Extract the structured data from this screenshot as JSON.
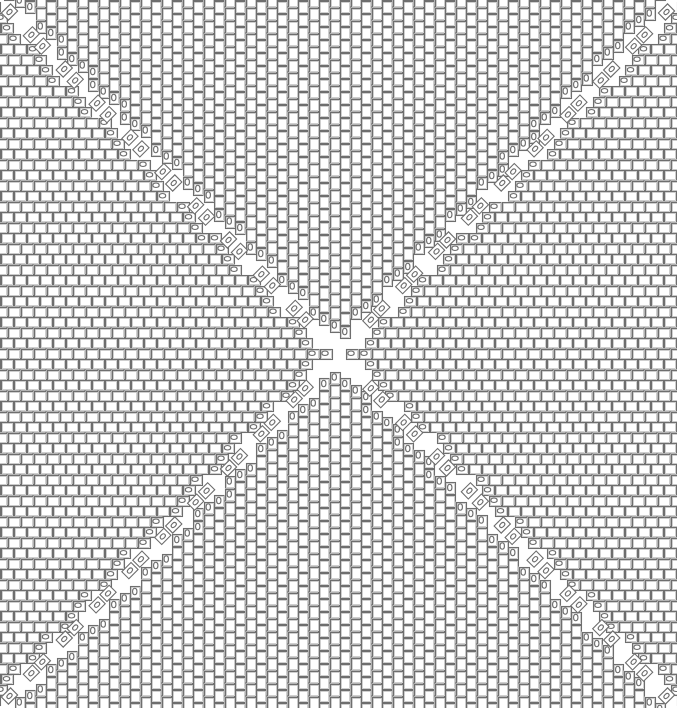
{
  "title": "Brick tiling pattern with diagonal marked tiles",
  "canvas": {
    "width": 677,
    "height": 708
  },
  "pattern": {
    "center": {
      "x": 338,
      "y": 354
    },
    "pitch": 10.5,
    "brick_long": 13,
    "brick_short": 9.5,
    "stroke_color": "#6e6e6e",
    "fill_color": "#ffffff",
    "line_width": 1.1,
    "regions": [
      {
        "name": "top",
        "orientation": "vertical"
      },
      {
        "name": "bottom",
        "orientation": "vertical"
      },
      {
        "name": "left",
        "orientation": "horizontal"
      },
      {
        "name": "right",
        "orientation": "horizontal"
      }
    ],
    "diagonal_marker": {
      "glyph": "0",
      "tile_shape": "rotated-square"
    }
  }
}
